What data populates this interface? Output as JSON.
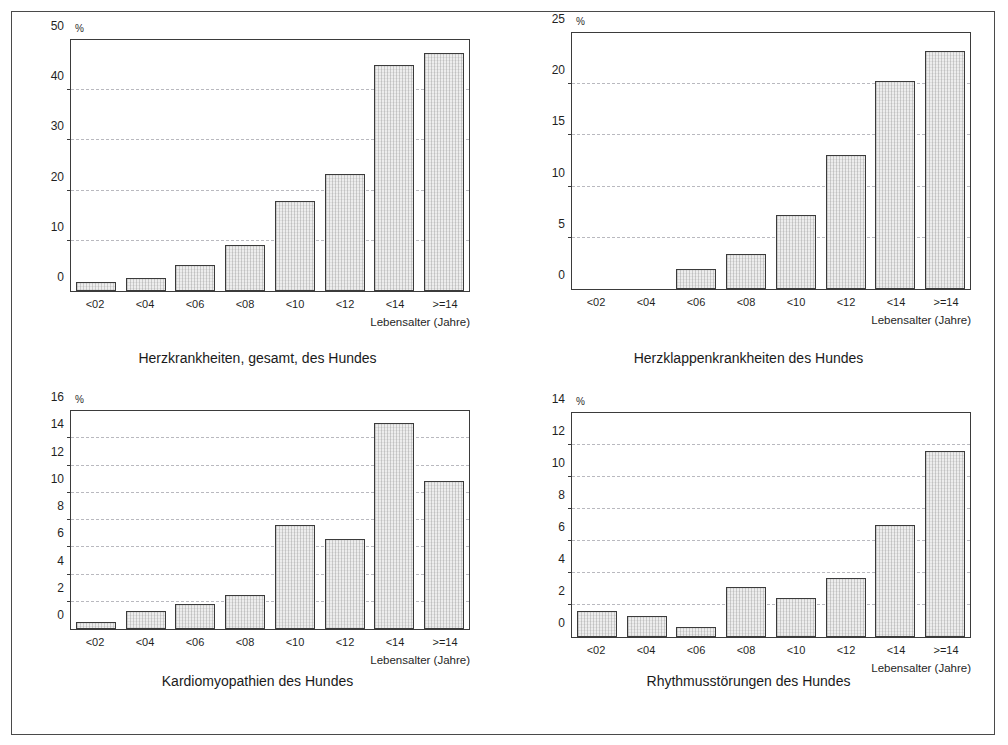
{
  "figure": {
    "unit_symbol": "%",
    "x_axis_title": "Lebensalter (Jahre)",
    "categories": [
      "<02",
      "<04",
      "<06",
      "<08",
      "<10",
      "<12",
      "<14",
      ">=14"
    ],
    "frame_color": "#4a4a4a",
    "bar_fill_color": "#ededed",
    "bar_border_color": "#3b3b3b",
    "gridline_color": "#b9b9bf"
  },
  "chart_data": [
    {
      "id": "herzkrankheiten-gesamt",
      "type": "bar",
      "title": "Herzkrankheiten, gesamt, des Hundes",
      "xlabel": "Lebensalter (Jahre)",
      "ylabel": "%",
      "categories": [
        "<02",
        "<04",
        "<06",
        "<08",
        "<10",
        "<12",
        "<14",
        ">=14"
      ],
      "values": [
        1.8,
        2.5,
        5.2,
        9.2,
        18.0,
        23.3,
        45.0,
        47.5
      ],
      "ylim": [
        0,
        50
      ],
      "yticks": [
        0,
        10,
        20,
        30,
        40,
        50
      ],
      "grid": true,
      "legend": "none"
    },
    {
      "id": "herzklappenkrankheiten",
      "type": "bar",
      "title": "Herzklappenkrankheiten des Hundes",
      "xlabel": "Lebensalter (Jahre)",
      "ylabel": "%",
      "categories": [
        "<02",
        "<04",
        "<06",
        "<08",
        "<10",
        "<12",
        "<14",
        ">=14"
      ],
      "values": [
        0.0,
        0.0,
        2.0,
        3.4,
        7.2,
        13.1,
        20.3,
        23.2
      ],
      "ylim": [
        0,
        25
      ],
      "yticks": [
        0,
        5,
        10,
        15,
        20,
        25
      ],
      "grid": true,
      "legend": "none"
    },
    {
      "id": "kardiomyopathien",
      "type": "bar",
      "title": "Kardiomyopathien des Hundes",
      "xlabel": "Lebensalter (Jahre)",
      "ylabel": "%",
      "categories": [
        "<02",
        "<04",
        "<06",
        "<08",
        "<10",
        "<12",
        "<14",
        ">=14"
      ],
      "values": [
        0.5,
        1.3,
        1.8,
        2.5,
        7.6,
        6.6,
        15.1,
        10.9
      ],
      "ylim": [
        0,
        16
      ],
      "yticks": [
        0,
        2,
        4,
        6,
        8,
        10,
        12,
        14,
        16
      ],
      "grid": true,
      "legend": "none"
    },
    {
      "id": "rhythmusstoerungen",
      "type": "bar",
      "title": "Rhythmusstörungen des Hundes",
      "xlabel": "Lebensalter (Jahre)",
      "ylabel": "%",
      "categories": [
        "<02",
        "<04",
        "<06",
        "<08",
        "<10",
        "<12",
        "<14",
        ">=14"
      ],
      "values": [
        1.6,
        1.3,
        0.65,
        3.1,
        2.45,
        3.7,
        7.0,
        11.6
      ],
      "ylim": [
        0,
        14
      ],
      "yticks": [
        0,
        2,
        4,
        6,
        8,
        10,
        12,
        14
      ],
      "grid": true,
      "legend": "none"
    }
  ]
}
